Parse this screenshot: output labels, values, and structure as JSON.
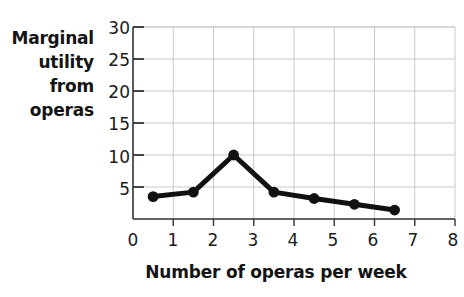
{
  "chart_data": {
    "type": "line",
    "title": "",
    "xlabel": "Number of operas per week",
    "ylabel": "Marginal utility from operas",
    "ylabel_lines": [
      "Marginal",
      "utility",
      "from",
      "operas"
    ],
    "x": [
      0.5,
      1.5,
      2.5,
      3.5,
      4.5,
      5.5,
      6.5
    ],
    "values": [
      3.5,
      4.2,
      10,
      4.2,
      3.2,
      2.3,
      1.4
    ],
    "series": [
      {
        "name": "Marginal utility from operas",
        "values": [
          3.5,
          4.2,
          10,
          4.2,
          3.2,
          2.3,
          1.4
        ]
      }
    ],
    "xlim": [
      0,
      8
    ],
    "ylim": [
      0,
      30
    ],
    "xticks": [
      0,
      1,
      2,
      3,
      4,
      5,
      6,
      7,
      8
    ],
    "xtick_labels": [
      "0",
      "1",
      "2",
      "3",
      "4",
      "5",
      "6",
      "7",
      "8"
    ],
    "yticks": [
      5,
      10,
      15,
      20,
      25,
      30
    ],
    "ytick_labels": [
      "5",
      "10",
      "15",
      "20",
      "25",
      "30"
    ],
    "grid": true,
    "grid_color": "#c9c9c9",
    "legend": "none",
    "line_color": "#111111",
    "marker": "circle",
    "marker_color": "#111111",
    "axis_color": "#333333"
  }
}
